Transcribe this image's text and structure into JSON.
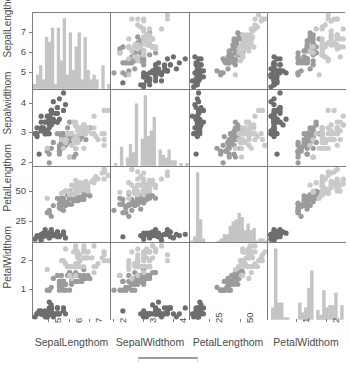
{
  "figure": {
    "type": "scatter-plot-matrix",
    "background": "#ffffff",
    "frame_color": "#7d7d7d",
    "scalebar_color": "#9a9a9a"
  },
  "variables": [
    {
      "key": "SepalLength",
      "axis_label": "SepalLengthom",
      "y_axis_label": "SepalLengthom",
      "ticks": [
        "5",
        "6",
        "7"
      ],
      "tick_values": [
        5,
        6,
        7
      ],
      "range": [
        4.2,
        8.0
      ]
    },
    {
      "key": "SepalWidth",
      "axis_label": "SepalWidthom",
      "y_axis_label": "Sepalwidthom",
      "ticks": [
        "2",
        "3",
        "4"
      ],
      "tick_values": [
        2,
        3,
        4
      ],
      "range": [
        1.9,
        4.5
      ]
    },
    {
      "key": "PetalLength",
      "axis_label": "PetalLengthom",
      "y_axis_label": "PetalLengthom",
      "ticks": [
        "25",
        "50"
      ],
      "tick_values": [
        2.5,
        5.0
      ],
      "range": [
        0.8,
        7.1
      ]
    },
    {
      "key": "PetalWidth",
      "axis_label": "PetalWidthom",
      "y_axis_label": "PetalWidthom",
      "ticks": [
        "1",
        "2"
      ],
      "tick_values": [
        1,
        2
      ],
      "range": [
        0.0,
        2.6
      ]
    }
  ],
  "series_colors": {
    "group_a": "#6e6e6e",
    "group_b": "#9b9b9b",
    "group_c": "#c9c9c9",
    "histogram": "#c4c4c4"
  },
  "chart_data": {
    "type": "scatter",
    "title": "",
    "xlabel": "",
    "ylabel": "",
    "grid": false,
    "legend": "none",
    "matrix_size": 4,
    "diagonal": "histogram",
    "n_points": 150,
    "groups": [
      "group_a",
      "group_b",
      "group_c"
    ],
    "group_sizes": [
      50,
      50,
      50
    ],
    "columns": [
      "SepalLength",
      "SepalWidth",
      "PetalLength",
      "PetalWidth"
    ],
    "axis_ranges": {
      "SepalLength": [
        4.2,
        8.0
      ],
      "SepalWidth": [
        1.9,
        4.5
      ],
      "PetalLength": [
        0.8,
        7.1
      ],
      "PetalWidth": [
        0.0,
        2.6
      ]
    },
    "points": {
      "SepalLength": [
        5.1,
        4.9,
        4.7,
        4.6,
        5.0,
        5.4,
        4.6,
        5.0,
        4.4,
        4.9,
        5.4,
        4.8,
        4.8,
        4.3,
        5.8,
        5.7,
        5.4,
        5.1,
        5.7,
        5.1,
        5.4,
        5.1,
        4.6,
        5.1,
        4.8,
        5.0,
        5.0,
        5.2,
        5.2,
        4.7,
        4.8,
        5.4,
        5.2,
        5.5,
        4.9,
        5.0,
        5.5,
        4.9,
        4.4,
        5.1,
        5.0,
        4.5,
        4.4,
        5.0,
        5.1,
        4.8,
        5.1,
        4.6,
        5.3,
        5.0,
        7.0,
        6.4,
        6.9,
        5.5,
        6.5,
        5.7,
        6.3,
        4.9,
        6.6,
        5.2,
        5.0,
        5.9,
        6.0,
        6.1,
        5.6,
        6.7,
        5.6,
        5.8,
        6.2,
        5.6,
        5.9,
        6.1,
        6.3,
        6.1,
        6.4,
        6.6,
        6.8,
        6.7,
        6.0,
        5.7,
        5.5,
        5.5,
        5.8,
        6.0,
        5.4,
        6.0,
        6.7,
        6.3,
        5.6,
        5.5,
        5.5,
        6.1,
        5.8,
        5.0,
        5.6,
        5.7,
        5.7,
        6.2,
        5.1,
        5.7,
        6.3,
        5.8,
        7.1,
        6.3,
        6.5,
        7.6,
        4.9,
        7.3,
        6.7,
        7.2,
        6.5,
        6.4,
        6.8,
        5.7,
        5.8,
        6.4,
        6.5,
        7.7,
        7.7,
        6.0,
        6.9,
        5.6,
        7.7,
        6.3,
        6.7,
        7.2,
        6.2,
        6.1,
        6.4,
        7.2,
        7.4,
        7.9,
        6.4,
        6.3,
        6.1,
        7.7,
        6.3,
        6.4,
        6.0,
        6.9,
        6.7,
        6.9,
        5.8,
        6.8,
        6.7,
        6.7,
        6.3,
        6.5,
        6.2,
        5.9
      ],
      "SepalWidth": [
        3.5,
        3.0,
        3.2,
        3.1,
        3.6,
        3.9,
        3.4,
        3.4,
        2.9,
        3.1,
        3.7,
        3.4,
        3.0,
        3.0,
        4.0,
        4.4,
        3.9,
        3.5,
        3.8,
        3.8,
        3.4,
        3.7,
        3.6,
        3.3,
        3.4,
        3.0,
        3.4,
        3.5,
        3.4,
        3.2,
        3.1,
        3.4,
        4.1,
        4.2,
        3.1,
        3.2,
        3.5,
        3.6,
        3.0,
        3.4,
        3.5,
        2.3,
        3.2,
        3.5,
        3.8,
        3.0,
        3.8,
        3.2,
        3.7,
        3.3,
        3.2,
        3.2,
        3.1,
        2.3,
        2.8,
        2.8,
        3.3,
        2.4,
        2.9,
        2.7,
        2.0,
        3.0,
        2.2,
        2.9,
        2.9,
        3.1,
        3.0,
        2.7,
        2.2,
        2.5,
        3.2,
        2.8,
        2.5,
        2.8,
        2.9,
        3.0,
        2.8,
        3.0,
        2.9,
        2.6,
        2.4,
        2.4,
        2.7,
        2.7,
        3.0,
        3.4,
        3.1,
        2.3,
        3.0,
        2.5,
        2.6,
        3.0,
        2.6,
        2.3,
        2.7,
        3.0,
        2.9,
        2.9,
        2.5,
        2.8,
        3.3,
        2.7,
        3.0,
        2.9,
        3.0,
        3.0,
        2.5,
        2.9,
        2.5,
        3.6,
        3.2,
        2.7,
        3.0,
        2.5,
        2.8,
        3.2,
        3.0,
        3.8,
        2.6,
        2.2,
        3.2,
        2.8,
        2.8,
        2.7,
        3.3,
        3.2,
        2.8,
        3.0,
        2.8,
        3.0,
        2.8,
        3.8,
        2.8,
        2.8,
        2.6,
        3.0,
        3.4,
        3.1,
        3.0,
        3.1,
        3.1,
        3.1,
        2.7,
        3.2,
        3.3,
        3.0,
        2.5,
        3.0,
        3.4,
        3.0
      ],
      "PetalLength": [
        1.4,
        1.4,
        1.3,
        1.5,
        1.4,
        1.7,
        1.4,
        1.5,
        1.4,
        1.5,
        1.5,
        1.6,
        1.4,
        1.1,
        1.2,
        1.5,
        1.3,
        1.4,
        1.7,
        1.5,
        1.7,
        1.5,
        1.0,
        1.7,
        1.9,
        1.6,
        1.6,
        1.5,
        1.4,
        1.6,
        1.6,
        1.5,
        1.5,
        1.4,
        1.5,
        1.2,
        1.3,
        1.4,
        1.3,
        1.5,
        1.3,
        1.3,
        1.3,
        1.6,
        1.9,
        1.4,
        1.6,
        1.4,
        1.5,
        1.4,
        4.7,
        4.5,
        4.9,
        4.0,
        4.6,
        4.5,
        4.7,
        3.3,
        4.6,
        3.9,
        3.5,
        4.2,
        4.0,
        4.7,
        3.6,
        4.4,
        4.5,
        4.1,
        4.5,
        3.9,
        4.8,
        4.0,
        4.9,
        4.7,
        4.3,
        4.4,
        4.8,
        5.0,
        4.5,
        3.5,
        3.8,
        3.7,
        3.9,
        5.1,
        4.5,
        4.5,
        4.7,
        4.4,
        4.1,
        4.0,
        4.4,
        4.6,
        4.0,
        3.3,
        4.2,
        4.2,
        4.2,
        4.3,
        3.0,
        4.1,
        6.0,
        5.1,
        5.9,
        5.6,
        5.8,
        6.6,
        4.5,
        6.3,
        5.8,
        6.1,
        5.1,
        5.3,
        5.5,
        5.0,
        5.1,
        5.3,
        5.5,
        6.7,
        6.9,
        5.0,
        5.7,
        4.9,
        6.7,
        4.9,
        5.7,
        6.0,
        4.8,
        4.9,
        5.6,
        5.8,
        6.1,
        6.4,
        5.6,
        5.1,
        5.6,
        6.1,
        5.6,
        5.5,
        4.8,
        5.4,
        5.6,
        5.1,
        5.1,
        5.9,
        5.7,
        5.2,
        5.0,
        5.2,
        5.4,
        5.1
      ],
      "PetalWidth": [
        0.2,
        0.2,
        0.2,
        0.2,
        0.2,
        0.4,
        0.3,
        0.2,
        0.2,
        0.1,
        0.2,
        0.2,
        0.1,
        0.1,
        0.2,
        0.4,
        0.4,
        0.3,
        0.3,
        0.3,
        0.2,
        0.4,
        0.2,
        0.5,
        0.2,
        0.2,
        0.4,
        0.2,
        0.2,
        0.2,
        0.2,
        0.4,
        0.1,
        0.2,
        0.2,
        0.2,
        0.2,
        0.1,
        0.2,
        0.2,
        0.3,
        0.3,
        0.2,
        0.6,
        0.4,
        0.3,
        0.2,
        0.2,
        0.2,
        0.2,
        1.4,
        1.5,
        1.5,
        1.3,
        1.5,
        1.3,
        1.6,
        1.0,
        1.3,
        1.4,
        1.0,
        1.5,
        1.0,
        1.4,
        1.3,
        1.4,
        1.5,
        1.0,
        1.5,
        1.1,
        1.8,
        1.3,
        1.5,
        1.2,
        1.3,
        1.4,
        1.4,
        1.7,
        1.5,
        1.0,
        1.1,
        1.0,
        1.2,
        1.6,
        1.5,
        1.6,
        1.5,
        1.3,
        1.3,
        1.3,
        1.2,
        1.4,
        1.2,
        1.0,
        1.3,
        1.2,
        1.3,
        1.3,
        1.1,
        1.3,
        2.5,
        1.9,
        2.1,
        1.8,
        2.2,
        2.1,
        1.7,
        1.8,
        1.8,
        2.5,
        2.0,
        1.9,
        2.1,
        2.0,
        2.4,
        2.3,
        1.8,
        2.2,
        2.3,
        1.5,
        2.3,
        2.0,
        2.0,
        1.8,
        2.1,
        1.8,
        1.8,
        1.8,
        2.1,
        1.6,
        1.9,
        2.0,
        2.2,
        1.5,
        1.4,
        2.3,
        2.4,
        1.8,
        1.8,
        2.1,
        2.4,
        2.3,
        1.9,
        2.3,
        2.5,
        2.3,
        1.9,
        2.0,
        2.3,
        1.8
      ]
    },
    "group_index": [
      0,
      0,
      0,
      0,
      0,
      0,
      0,
      0,
      0,
      0,
      0,
      0,
      0,
      0,
      0,
      0,
      0,
      0,
      0,
      0,
      0,
      0,
      0,
      0,
      0,
      0,
      0,
      0,
      0,
      0,
      0,
      0,
      0,
      0,
      0,
      0,
      0,
      0,
      0,
      0,
      0,
      0,
      0,
      0,
      0,
      0,
      0,
      0,
      0,
      0,
      1,
      1,
      1,
      1,
      1,
      1,
      1,
      1,
      1,
      1,
      1,
      1,
      1,
      1,
      1,
      1,
      1,
      1,
      1,
      1,
      1,
      1,
      1,
      1,
      1,
      1,
      1,
      1,
      1,
      1,
      1,
      1,
      1,
      1,
      1,
      1,
      1,
      1,
      1,
      1,
      1,
      1,
      1,
      1,
      1,
      1,
      1,
      1,
      1,
      1,
      2,
      2,
      2,
      2,
      2,
      2,
      2,
      2,
      2,
      2,
      2,
      2,
      2,
      2,
      2,
      2,
      2,
      2,
      2,
      2,
      2,
      2,
      2,
      2,
      2,
      2,
      2,
      2,
      2,
      2,
      2,
      2,
      2,
      2,
      2,
      2,
      2,
      2,
      2,
      2,
      2,
      2,
      2,
      2,
      2,
      2,
      2,
      2,
      2,
      2
    ]
  }
}
